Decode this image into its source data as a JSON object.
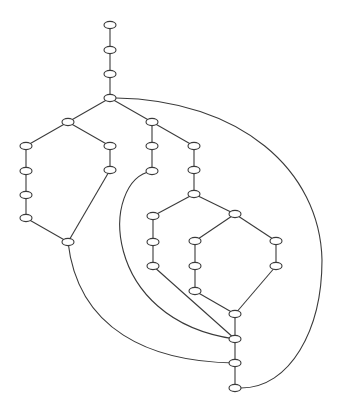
{
  "diagram": {
    "type": "directed-graph",
    "colors": {
      "stroke": "#3a3a3a",
      "background": "#ffffff",
      "node_fill": "#ffffff"
    },
    "node_rx": 6,
    "node_ry": 3.6,
    "nodes": [
      {
        "id": "n1",
        "x": 110,
        "y": 25
      },
      {
        "id": "n2",
        "x": 110,
        "y": 50
      },
      {
        "id": "n3",
        "x": 110,
        "y": 74
      },
      {
        "id": "n4",
        "x": 110,
        "y": 98
      },
      {
        "id": "n5",
        "x": 68,
        "y": 122
      },
      {
        "id": "n6",
        "x": 152,
        "y": 122
      },
      {
        "id": "n7",
        "x": 26,
        "y": 146
      },
      {
        "id": "n8",
        "x": 26,
        "y": 171
      },
      {
        "id": "n9",
        "x": 26,
        "y": 195
      },
      {
        "id": "n10",
        "x": 26,
        "y": 218
      },
      {
        "id": "n11",
        "x": 110,
        "y": 146
      },
      {
        "id": "n12",
        "x": 110,
        "y": 170
      },
      {
        "id": "n13",
        "x": 68,
        "y": 242
      },
      {
        "id": "n14",
        "x": 152,
        "y": 146
      },
      {
        "id": "n15",
        "x": 152,
        "y": 171
      },
      {
        "id": "n16",
        "x": 194,
        "y": 146
      },
      {
        "id": "n17",
        "x": 194,
        "y": 170
      },
      {
        "id": "n18",
        "x": 194,
        "y": 194
      },
      {
        "id": "n19",
        "x": 153,
        "y": 216
      },
      {
        "id": "n20",
        "x": 153,
        "y": 242
      },
      {
        "id": "n21",
        "x": 153,
        "y": 266
      },
      {
        "id": "n22",
        "x": 235,
        "y": 214
      },
      {
        "id": "n23",
        "x": 195,
        "y": 241
      },
      {
        "id": "n24",
        "x": 195,
        "y": 266
      },
      {
        "id": "n25",
        "x": 195,
        "y": 291
      },
      {
        "id": "n26",
        "x": 276,
        "y": 241
      },
      {
        "id": "n27",
        "x": 276,
        "y": 266
      },
      {
        "id": "n28",
        "x": 235,
        "y": 314
      },
      {
        "id": "n29",
        "x": 235,
        "y": 339
      },
      {
        "id": "n30",
        "x": 235,
        "y": 363
      },
      {
        "id": "n31",
        "x": 235,
        "y": 388
      }
    ],
    "edges": [
      {
        "from": "n1",
        "to": "n2",
        "path": "M110,25 L110,50"
      },
      {
        "from": "n2",
        "to": "n3",
        "path": "M110,50 L110,74"
      },
      {
        "from": "n3",
        "to": "n4",
        "path": "M110,74 L110,98"
      },
      {
        "from": "n4",
        "to": "n5",
        "path": "M110,98 L68,122"
      },
      {
        "from": "n4",
        "to": "n6",
        "path": "M110,98 L152,122"
      },
      {
        "from": "n5",
        "to": "n7",
        "path": "M68,122 L26,146"
      },
      {
        "from": "n7",
        "to": "n8",
        "path": "M26,146 L26,171"
      },
      {
        "from": "n8",
        "to": "n9",
        "path": "M26,171 L26,195"
      },
      {
        "from": "n9",
        "to": "n10",
        "path": "M26,195 L26,218"
      },
      {
        "from": "n10",
        "to": "n13",
        "path": "M26,218 L68,242"
      },
      {
        "from": "n5",
        "to": "n11",
        "path": "M68,122 L110,146"
      },
      {
        "from": "n11",
        "to": "n12",
        "path": "M110,146 L110,170"
      },
      {
        "from": "n12",
        "to": "n13",
        "path": "M110,170 L68,242"
      },
      {
        "from": "n6",
        "to": "n14",
        "path": "M152,122 L152,146"
      },
      {
        "from": "n14",
        "to": "n15",
        "path": "M152,146 L152,171"
      },
      {
        "from": "n6",
        "to": "n16",
        "path": "M152,122 L194,146"
      },
      {
        "from": "n16",
        "to": "n17",
        "path": "M194,146 L194,170"
      },
      {
        "from": "n17",
        "to": "n18",
        "path": "M194,170 L194,194"
      },
      {
        "from": "n18",
        "to": "n19",
        "path": "M194,194 L153,216"
      },
      {
        "from": "n19",
        "to": "n20",
        "path": "M153,216 L153,242"
      },
      {
        "from": "n20",
        "to": "n21",
        "path": "M153,242 L153,266"
      },
      {
        "from": "n18",
        "to": "n22",
        "path": "M194,194 L235,214"
      },
      {
        "from": "n22",
        "to": "n23",
        "path": "M235,214 L195,241"
      },
      {
        "from": "n23",
        "to": "n24",
        "path": "M195,241 L195,266"
      },
      {
        "from": "n24",
        "to": "n25",
        "path": "M195,266 L195,291"
      },
      {
        "from": "n22",
        "to": "n26",
        "path": "M235,214 L276,241"
      },
      {
        "from": "n26",
        "to": "n27",
        "path": "M276,241 L276,266"
      },
      {
        "from": "n25",
        "to": "n28",
        "path": "M195,291 L235,314"
      },
      {
        "from": "n27",
        "to": "n28",
        "path": "M276,266 L235,314"
      },
      {
        "from": "n28",
        "to": "n29",
        "path": "M235,314 L235,339"
      },
      {
        "from": "n29",
        "to": "n30",
        "path": "M235,339 L235,363"
      },
      {
        "from": "n30",
        "to": "n31",
        "path": "M235,363 L235,388"
      },
      {
        "from": "n21",
        "to": "n29",
        "path": "M153,266 L235,339"
      },
      {
        "from": "n15",
        "to": "n29",
        "path": "M152,171 C100,180 100,320 235,339"
      },
      {
        "from": "n13",
        "to": "n30",
        "path": "M68,242 C78,330 150,362 235,363"
      },
      {
        "from": "n4",
        "to": "n31",
        "path": "M116,98 C240,100 320,170 322,260 C322,330 290,388 241,388"
      }
    ]
  }
}
